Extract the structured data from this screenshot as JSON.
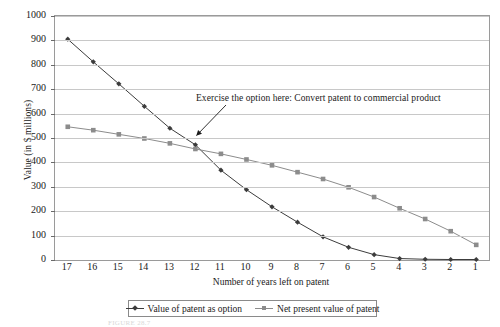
{
  "chart_data": {
    "type": "line",
    "title": "",
    "xlabel": "Number of years left on patent",
    "ylabel": "Value (in $ millions)",
    "categories": [
      17,
      16,
      15,
      14,
      13,
      12,
      11,
      10,
      9,
      8,
      7,
      6,
      5,
      4,
      3,
      2,
      1
    ],
    "xlim": [
      17,
      1
    ],
    "ylim": [
      0,
      1000
    ],
    "ytick_values": [
      0,
      100,
      200,
      300,
      400,
      500,
      600,
      700,
      800,
      900,
      1000
    ],
    "ytick_labels": [
      "0",
      "100",
      "200",
      "300",
      "400",
      "500",
      "600",
      "700",
      "800",
      "900",
      "1000"
    ],
    "xtick_labels": [
      "17",
      "16",
      "15",
      "14",
      "13",
      "12",
      "11",
      "10",
      "9",
      "8",
      "7",
      "6",
      "5",
      "4",
      "3",
      "2",
      "1"
    ],
    "grid": true,
    "legend_position": "bottom",
    "series": [
      {
        "name": "Value of patent as option",
        "color": "#3c3c3c",
        "marker": "diamond",
        "values": [
          905,
          812,
          722,
          630,
          540,
          472,
          368,
          288,
          218,
          155,
          95,
          52,
          22,
          6,
          3,
          2,
          2
        ]
      },
      {
        "name": "Net present value of patent",
        "color": "#8c8c8c",
        "marker": "square",
        "values": [
          546,
          532,
          515,
          498,
          478,
          455,
          435,
          412,
          388,
          360,
          332,
          298,
          258,
          212,
          168,
          118,
          62
        ]
      }
    ],
    "annotations": [
      {
        "text": "Exercise the option here: Convert patent to commercial product",
        "points_to_x": 12,
        "points_to_y": 472
      }
    ]
  },
  "legend": {
    "entries": [
      {
        "label": "Value of patent as option"
      },
      {
        "label": "Net present value of patent"
      }
    ]
  },
  "caption": {
    "text": "FIGURE 28.7"
  }
}
